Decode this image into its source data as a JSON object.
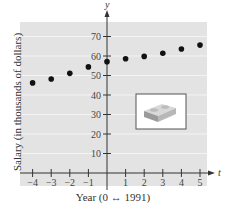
{
  "chart_data": {
    "type": "scatter",
    "title": "",
    "xlabel": "Year (0 ↔ 1991)",
    "ylabel": "Salary (in thousands of dollars)",
    "x_axis_name": "t",
    "y_axis_name": "y",
    "x": [
      -4,
      -3,
      -2,
      -1,
      0,
      1,
      2,
      3,
      4,
      5
    ],
    "y": [
      46.2,
      48.2,
      51.1,
      54.4,
      57.1,
      58.6,
      59.8,
      61.4,
      63.6,
      65.6
    ],
    "xticks": [
      -4,
      -3,
      -2,
      -1,
      1,
      2,
      3,
      4,
      5
    ],
    "xtick_labels": [
      "−4",
      "−3",
      "−2",
      "−1",
      "1",
      "2",
      "3",
      "4",
      "5"
    ],
    "yticks": [
      10,
      20,
      30,
      40,
      50,
      60,
      70
    ],
    "ytick_labels": [
      "10",
      "20",
      "30",
      "40",
      "50",
      "60",
      "70"
    ],
    "xlim": [
      -4.6,
      5.4
    ],
    "ylim": [
      0,
      78
    ],
    "grid": true,
    "legend": null,
    "annotations": [
      "inset image of a brick/block"
    ]
  },
  "colors": {
    "plot_background": "#e3e3e3",
    "gridline": "#f4f4f4",
    "axis": "#333333",
    "marker": "#111111"
  }
}
